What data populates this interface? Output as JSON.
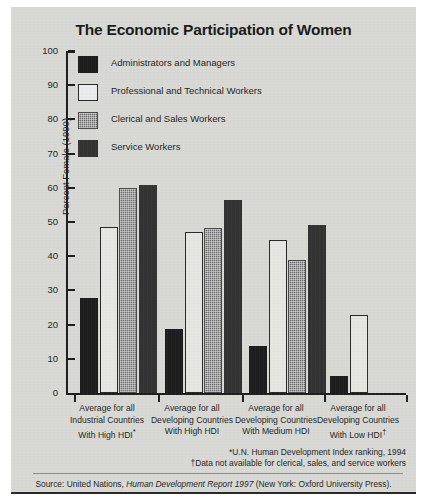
{
  "chart_data": {
    "type": "bar",
    "title": "The Economic Participation of Women",
    "xlabel": "",
    "ylabel": "Percent Female (1990)",
    "ylim": [
      0,
      100
    ],
    "yticks": [
      0,
      10,
      20,
      30,
      40,
      50,
      60,
      70,
      80,
      90,
      100
    ],
    "grid": false,
    "legend_position": "inside-top-left",
    "categories": [
      "Average for all Industrial Countries With High HDI*",
      "Average for all Developing Countries With High HDI",
      "Average for all Developing Countries With Medium HDI",
      "Average for all Developing Countries With Low HDI†"
    ],
    "series": [
      {
        "name": "Administrators and Managers",
        "values": [
          27.8,
          18.7,
          13.8,
          5.0
        ]
      },
      {
        "name": "Professional and Technical Workers",
        "values": [
          48.5,
          47.0,
          44.7,
          22.8
        ]
      },
      {
        "name": "Clerical and Sales Workers",
        "values": [
          59.8,
          48.2,
          39.0,
          null
        ]
      },
      {
        "name": "Service Workers",
        "values": [
          60.8,
          56.5,
          49.0,
          null
        ]
      }
    ],
    "annotations": [
      "*U.N. Human Development Index ranking, 1994",
      "†Data not available for clerical, sales, and service workers"
    ],
    "source": "Source: United Nations, Human Development Report 1997 (New York: Oxford University Press)."
  },
  "legend": {
    "items": [
      {
        "label": "Administrators and Managers",
        "swatch": "admin",
        "color": "#1d1d1d"
      },
      {
        "label": "Professional and Technical Workers",
        "swatch": "prof",
        "color": "#eceded"
      },
      {
        "label": "Clerical and Sales Workers",
        "swatch": "cler",
        "color": "#6f6f6f"
      },
      {
        "label": "Service Workers",
        "swatch": "serv",
        "color": "#333333"
      }
    ]
  },
  "axis": {
    "y_title": "Percent Female (1990)",
    "y_tick_labels": [
      "100",
      "90",
      "80",
      "70",
      "60",
      "50",
      "40",
      "30",
      "20",
      "10",
      "0"
    ]
  },
  "xcats": [
    {
      "line1": "Average for all",
      "line2": "Industrial Countries",
      "line3": "With High HDI",
      "marker": "*"
    },
    {
      "line1": "Average for all",
      "line2": "Developing Countries",
      "line3": "With High HDI",
      "marker": ""
    },
    {
      "line1": "Average for all",
      "line2": "Developing Countries",
      "line3": "With Medium HDI",
      "marker": ""
    },
    {
      "line1": "Average for all",
      "line2": "Developing Countries",
      "line3": "With Low HDI",
      "marker": "†"
    }
  ],
  "footnotes": {
    "line1": "*U.N. Human Development Index ranking, 1994",
    "line2": "†Data not available for clerical, sales, and service workers"
  },
  "source": {
    "prefix": "Source: United Nations, ",
    "italic": "Human Development Report 1997",
    "suffix": " (New York: Oxford University Press)."
  }
}
